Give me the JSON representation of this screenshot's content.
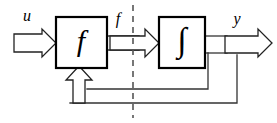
{
  "figure": {
    "type": "block-diagram",
    "background_color": "#ffffff",
    "line_color": "#333333",
    "box_stroke_color": "#000000",
    "divider_color": "#555555"
  },
  "blocks": [
    {
      "id": "f-block",
      "label": "f",
      "role": "nonlinear-function-block",
      "x": 56,
      "y": 17,
      "width": 51,
      "height": 51
    },
    {
      "id": "integrator-block",
      "label": "∫",
      "role": "integrator-block",
      "x": 159,
      "y": 17,
      "width": 46,
      "height": 51
    }
  ],
  "signals": [
    {
      "id": "u",
      "label": "u",
      "role": "input-signal",
      "x": 27,
      "y": 21
    },
    {
      "id": "f",
      "label": "f",
      "role": "intermediate-signal",
      "x": 118,
      "y": 24
    },
    {
      "id": "y",
      "label": "y",
      "role": "output-signal",
      "x": 237,
      "y": 24
    }
  ],
  "connectors": {
    "input_arrow": "block-arrow-right",
    "middle_arrow": "block-arrow-right",
    "output_arrow": "block-arrow-right",
    "feedback_arrow": "block-arrow-up",
    "feedback_paths": 2
  },
  "divider": {
    "id": "vertical-dashed-divider",
    "style": "dashed",
    "x": 133,
    "y_top": 5,
    "y_bottom": 118
  }
}
